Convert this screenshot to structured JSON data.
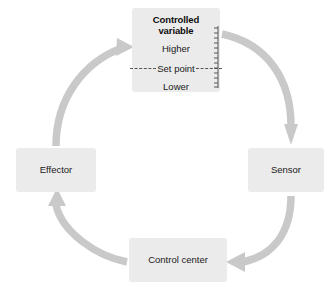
{
  "figure": {
    "type": "cycle-diagram",
    "direction": "clockwise",
    "background_color": "#ffffff",
    "box_fill_color": "#ebebeb",
    "arrow_color": "#c9c9c9",
    "text_color": "#1a1a1a"
  },
  "nodes": {
    "controlled_variable": {
      "id": "controlled-variable",
      "title": "Controlled variable",
      "levels": {
        "higher": "Higher",
        "set_point": "Set point",
        "lower": "Lower"
      },
      "position": "top"
    },
    "sensor": {
      "id": "sensor",
      "label": "Sensor",
      "position": "right"
    },
    "control_center": {
      "id": "control-center",
      "label": "Control center",
      "position": "bottom"
    },
    "effector": {
      "id": "effector",
      "label": "Effector",
      "position": "left"
    }
  },
  "arrows": [
    {
      "id": "arrow-controlled-variable-to-sensor",
      "from": "Controlled variable",
      "to": "Sensor",
      "shape": "arc",
      "head": "down"
    },
    {
      "id": "arrow-sensor-to-control-center",
      "from": "Sensor",
      "to": "Control center",
      "shape": "arc",
      "head": "left"
    },
    {
      "id": "arrow-control-center-to-effector",
      "from": "Control center",
      "to": "Effector",
      "shape": "arc",
      "head": "up"
    },
    {
      "id": "arrow-effector-to-controlled-variable",
      "from": "Effector",
      "to": "Controlled variable",
      "shape": "arc",
      "head": "up-right"
    },
    {
      "id": "arrow-into-controlled-variable-right",
      "from": "Sensor loop return",
      "to": "Controlled variable",
      "shape": "arc",
      "head": "left"
    }
  ]
}
